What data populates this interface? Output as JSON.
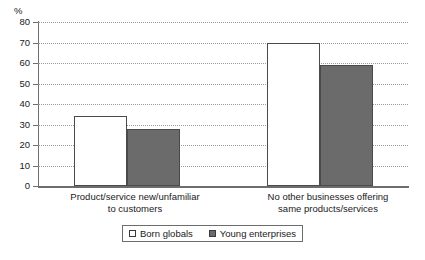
{
  "chart_data": {
    "type": "bar",
    "title": "",
    "xlabel": "",
    "ylabel": "%",
    "ylim": [
      0,
      80
    ],
    "ytick_step": 10,
    "yticks": [
      "80",
      "70",
      "60",
      "50",
      "40",
      "30",
      "20",
      "10",
      "0"
    ],
    "grid": true,
    "legend_position": "bottom",
    "categories": [
      "Product/service new/unfamiliar to customers",
      "No other businesses offering same products/services"
    ],
    "category_lines": [
      [
        "Product/service new/unfamiliar",
        "to customers"
      ],
      [
        "No other businesses offering",
        "same products/services"
      ]
    ],
    "series": [
      {
        "name": "Born globals",
        "color": "#ffffff",
        "values": [
          34,
          70
        ]
      },
      {
        "name": "Young enterprises",
        "color": "#6b6b6b",
        "values": [
          28,
          59
        ]
      }
    ]
  },
  "axis": {
    "unit_label": "%"
  },
  "legend": {
    "items": [
      {
        "label": "Born globals",
        "swatch": "white-square-swatch"
      },
      {
        "label": "Young enterprises",
        "swatch": "gray-square-swatch"
      }
    ]
  }
}
